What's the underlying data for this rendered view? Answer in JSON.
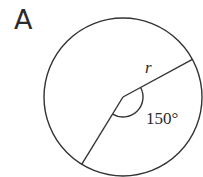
{
  "figure": {
    "panel_label": "A",
    "shape": "circle",
    "radius_label": "r",
    "angle_label": "150°",
    "angle_degrees": 150,
    "stroke_color": "#333333",
    "background_color": "#ffffff",
    "geometry": {
      "center": [
        123,
        97
      ],
      "radius": 79,
      "radius_line_angles_deg": [
        -28.5,
        121.5
      ],
      "angle_arc_radius": 20
    }
  }
}
